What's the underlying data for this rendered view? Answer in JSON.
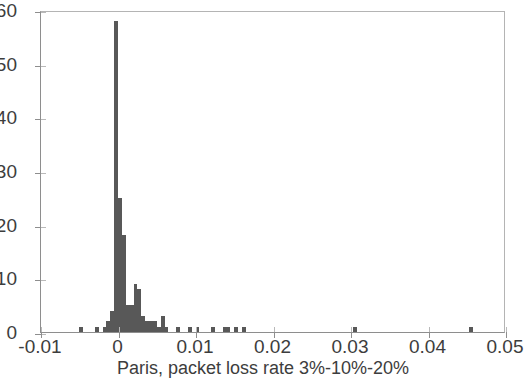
{
  "chart_data": {
    "type": "bar",
    "title": "",
    "subtitle": "",
    "xlabel": "Paris, packet loss rate 3%-10%-20%",
    "ylabel": "",
    "xlim": [
      -0.01,
      0.05
    ],
    "ylim": [
      0,
      60
    ],
    "xticks": [
      -0.01,
      0,
      0.01,
      0.02,
      0.03,
      0.04,
      0.05
    ],
    "xticklabels": [
      "-0.01",
      "0",
      "0.01",
      "0.02",
      "0.03",
      "0.04",
      "0.05"
    ],
    "yticks": [
      0,
      10,
      20,
      30,
      40,
      50,
      60
    ],
    "yticklabels": [
      "0",
      "10",
      "20",
      "30",
      "40",
      "50",
      "60"
    ],
    "grid": false,
    "legend": null,
    "bar_color": "#585858",
    "axis_color": "#8e8e8e",
    "background": "#ffffff",
    "bin_width": 0.0005,
    "series": [
      {
        "name": "Paris packet loss rate histogram",
        "x": [
          -0.0048,
          -0.0028,
          -0.0018,
          -0.0013,
          -0.0008,
          -0.0003,
          0.0002,
          0.0007,
          0.0012,
          0.0017,
          0.0022,
          0.0027,
          0.0032,
          0.0037,
          0.0042,
          0.0047,
          0.0052,
          0.0057,
          0.0062,
          0.0077,
          0.0092,
          0.0102,
          0.0122,
          0.0137,
          0.0142,
          0.0152,
          0.0162,
          0.0305,
          0.0455
        ],
        "values": [
          1,
          1,
          1,
          2,
          4,
          58,
          25,
          18,
          5,
          5,
          9,
          8,
          3,
          2,
          2,
          2,
          1,
          3,
          1,
          1,
          1,
          1,
          1,
          1,
          1,
          1,
          1,
          1,
          1
        ]
      }
    ],
    "peak": {
      "x": 0.0,
      "value": 58
    }
  }
}
